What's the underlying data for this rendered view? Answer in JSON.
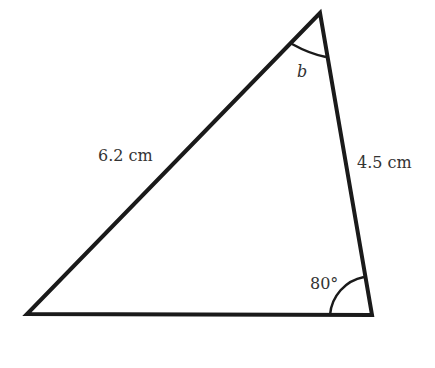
{
  "diagram": {
    "type": "triangle",
    "vertices": {
      "top": [
        320,
        13
      ],
      "bottom_left": [
        27,
        314
      ],
      "bottom_right": [
        372,
        315
      ]
    },
    "sides": {
      "left_side_label": "6.2 cm",
      "right_side_label": "4.5 cm"
    },
    "angles": {
      "top_angle_label": "b",
      "bottom_right_angle_label": "80°"
    },
    "colors": {
      "stroke": "#1a1a1a",
      "text": "#333333",
      "background": "#ffffff"
    }
  }
}
